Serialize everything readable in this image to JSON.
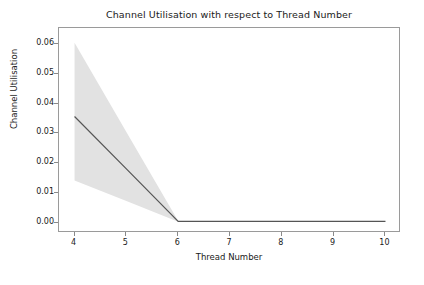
{
  "chart_data": {
    "type": "line",
    "title": "Channel Utilisation with respect to Thread Number",
    "xlabel": "Thread Number",
    "ylabel": "Channel Utilisation",
    "grid": false,
    "legend": null,
    "xlim": [
      3.7,
      10.3
    ],
    "ylim": [
      -0.0035,
      0.0655
    ],
    "xticks": [
      4,
      5,
      6,
      7,
      8,
      9,
      10
    ],
    "xtick_labels": [
      "4",
      "5",
      "6",
      "7",
      "8",
      "9",
      "10"
    ],
    "yticks": [
      0.0,
      0.01,
      0.02,
      0.03,
      0.04,
      0.05,
      0.06
    ],
    "ytick_labels": [
      "0.00",
      "0.01",
      "0.02",
      "0.03",
      "0.04",
      "0.05",
      "0.06"
    ],
    "x": [
      4,
      5,
      6,
      7,
      8,
      9,
      10
    ],
    "series": [
      {
        "name": "Channel Utilisation",
        "values": [
          0.0357,
          0.0181,
          0.0004,
          0.0004,
          0.0004,
          0.0004,
          0.0004
        ],
        "color": "#555555",
        "linewidth": 1.2
      }
    ],
    "band": {
      "name": "confidence interval",
      "upper": [
        0.0605,
        0.0305,
        0.0005,
        0.0005,
        0.0005,
        0.0005,
        0.0005
      ],
      "lower": [
        0.0142,
        0.0073,
        0.0003,
        0.0003,
        0.0003,
        0.0003,
        0.0003
      ],
      "color": "#e2e2e2",
      "opacity": 1
    }
  },
  "colors": {
    "background": "#ffffff",
    "axis": "#9a9a9a",
    "tick": "#8a8a8a",
    "text": "#1a1a1a",
    "line": "#555555",
    "band": "#e2e2e2"
  }
}
